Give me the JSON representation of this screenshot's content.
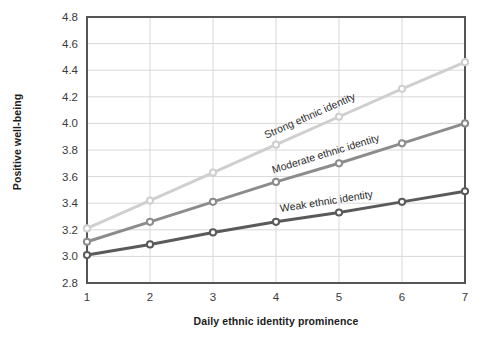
{
  "chart_data": {
    "type": "line",
    "title": "",
    "xlabel": "Daily ethnic identity prominence",
    "ylabel": "Positive well-being",
    "x": [
      1,
      2,
      3,
      4,
      5,
      6,
      7
    ],
    "xlim": [
      1,
      7
    ],
    "ylim": [
      2.8,
      4.8
    ],
    "xticks": [
      "1",
      "2",
      "3",
      "4",
      "5",
      "6",
      "7"
    ],
    "yticks": [
      "2.8",
      "3.0",
      "3.2",
      "3.4",
      "3.6",
      "3.8",
      "4.0",
      "4.2",
      "4.4",
      "4.6",
      "4.8"
    ],
    "grid": true,
    "legend_position": "inline-labels",
    "markers": "circle",
    "series": [
      {
        "name": "Strong ethnic identity",
        "color": "#cfcfcf",
        "values": [
          3.21,
          3.42,
          3.63,
          3.84,
          4.05,
          4.26,
          4.46
        ]
      },
      {
        "name": "Moderate ethnic identity",
        "color": "#8c8c8c",
        "values": [
          3.11,
          3.26,
          3.41,
          3.56,
          3.7,
          3.85,
          4.0
        ]
      },
      {
        "name": "Weak ethnic identity",
        "color": "#5a5a5a",
        "values": [
          3.01,
          3.09,
          3.18,
          3.26,
          3.33,
          3.41,
          3.49
        ]
      }
    ]
  },
  "annotations": [
    {
      "text": "Strong ethnic identity"
    },
    {
      "text": "Moderate ethnic identity"
    },
    {
      "text": "Weak ethnic identity"
    }
  ],
  "style": {
    "grid_color": "#d8d8d8",
    "frame_color": "#555555",
    "background": "#ffffff"
  }
}
